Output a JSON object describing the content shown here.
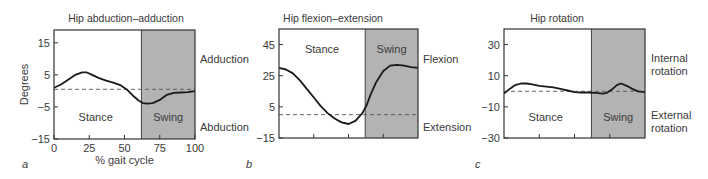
{
  "chart_data": [
    {
      "type": "line",
      "panel_label": "a",
      "title": "Hip abduction–adduction",
      "xlabel": "% gait cycle",
      "ylabel": "Degrees",
      "xlim": [
        0,
        100
      ],
      "ylim": [
        -15,
        19
      ],
      "xticks": [
        0,
        25,
        50,
        75,
        100
      ],
      "yticks": [
        -15,
        -5,
        5,
        15
      ],
      "ytick_labels": [
        "−15",
        "−5",
        "5",
        "15"
      ],
      "xtick_labels": [
        "0",
        "25",
        "50",
        "75",
        "100"
      ],
      "swing_start": 62,
      "stance_label": "Stance",
      "swing_label": "Swing",
      "reference_line": 0.5,
      "right_labels": {
        "top": "Adduction",
        "bottom": "Abduction"
      },
      "x": [
        0,
        5,
        10,
        15,
        20,
        23,
        27,
        32,
        37,
        42,
        47,
        52,
        56,
        60,
        63,
        66,
        70,
        75,
        80,
        85,
        90,
        95,
        100
      ],
      "values": [
        1,
        2,
        3.5,
        5,
        5.8,
        5.8,
        5,
        4,
        3.2,
        2.6,
        1.8,
        0.3,
        -1.5,
        -3,
        -3.8,
        -4,
        -3.8,
        -2.8,
        -1.2,
        -0.6,
        -0.5,
        -0.4,
        -0.1
      ]
    },
    {
      "type": "line",
      "panel_label": "b",
      "title": "Hip flexion–extension",
      "xlabel": "",
      "ylabel": "",
      "xlim": [
        0,
        100
      ],
      "ylim": [
        -15,
        55
      ],
      "xticks": [
        25,
        50,
        75
      ],
      "yticks": [
        -15,
        5,
        25,
        45
      ],
      "ytick_labels": [
        "−15",
        "5",
        "25",
        "45"
      ],
      "swing_start": 62,
      "stance_label": "Stance",
      "swing_label": "Swing",
      "reference_line": 0,
      "right_labels": {
        "top": "Flexion",
        "bottom": "Extension"
      },
      "x": [
        0,
        5,
        10,
        15,
        20,
        25,
        30,
        35,
        40,
        45,
        50,
        55,
        60,
        63,
        66,
        70,
        75,
        80,
        85,
        90,
        95,
        100
      ],
      "values": [
        30,
        29,
        26.5,
        22,
        16.5,
        11,
        5.5,
        1,
        -2.5,
        -5,
        -6,
        -4,
        1,
        6,
        13,
        21,
        28,
        31.5,
        32,
        31.5,
        30.5,
        30
      ]
    },
    {
      "type": "line",
      "panel_label": "c",
      "title": "Hip rotation",
      "xlabel": "",
      "ylabel": "",
      "xlim": [
        0,
        100
      ],
      "ylim": [
        -30,
        40
      ],
      "xticks": [
        25,
        50,
        75
      ],
      "yticks": [
        -30,
        -10,
        10,
        30
      ],
      "ytick_labels": [
        "−30",
        "−10",
        "10",
        "30"
      ],
      "swing_start": 62,
      "stance_label": "Stance",
      "swing_label": "Swing",
      "reference_line": 0,
      "right_labels": {
        "top": "Internal rotation",
        "top_lines": [
          "Internal",
          "rotation"
        ],
        "bottom": "External rotation",
        "bottom_lines": [
          "External",
          "rotation"
        ]
      },
      "x": [
        0,
        4,
        8,
        12,
        16,
        20,
        25,
        30,
        35,
        40,
        45,
        50,
        55,
        60,
        65,
        70,
        73,
        77,
        80,
        83,
        87,
        91,
        95,
        100
      ],
      "values": [
        -1.5,
        1.5,
        4,
        5,
        5,
        4.5,
        3.5,
        3,
        2.5,
        1.5,
        0.5,
        -0.5,
        -0.8,
        -0.8,
        -1,
        -1.5,
        -1,
        1.5,
        4,
        5,
        3.5,
        1.5,
        0,
        -0.5
      ]
    }
  ]
}
